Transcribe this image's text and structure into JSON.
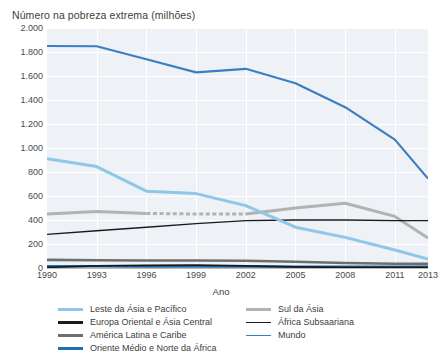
{
  "chart_data": {
    "type": "line",
    "title": "Número na pobreza extrema (milhões)",
    "xlabel": "Ano",
    "ylabel": "",
    "grid": true,
    "legend_position": "bottom",
    "xlim": [
      1990,
      2013
    ],
    "ylim": [
      0,
      2000
    ],
    "yticks": [
      "0",
      "200",
      "400",
      "600",
      "800",
      "1.000",
      "1.200",
      "1.400",
      "1.600",
      "1.800",
      "2.000"
    ],
    "ytick_values": [
      0,
      200,
      400,
      600,
      800,
      1000,
      1200,
      1400,
      1600,
      1800,
      2000
    ],
    "xticks": [
      "1990",
      "1993",
      "1996",
      "1999",
      "2002",
      "2005",
      "2008",
      "2011",
      "2013"
    ],
    "xtick_values": [
      1990,
      1993,
      1996,
      1999,
      2002,
      2005,
      2008,
      2011,
      2013
    ],
    "x": [
      1990,
      1993,
      1996,
      1999,
      2002,
      2005,
      2008,
      2011,
      2013
    ],
    "series": [
      {
        "name": "Mundo",
        "color": "#3a7fc1",
        "width": 2.2,
        "dashed_range": null,
        "values": [
          1850,
          1848,
          1740,
          1630,
          1660,
          1540,
          1340,
          1070,
          745
        ]
      },
      {
        "name": "Leste da Ásia e Pacífico",
        "color": "#8ec7e8",
        "width": 3.0,
        "dashed_range": null,
        "values": [
          910,
          845,
          640,
          620,
          520,
          340,
          255,
          150,
          75
        ]
      },
      {
        "name": "Sul da Ásia",
        "color": "#b2b2b2",
        "width": 3.0,
        "dashed_range": [
          1996,
          2002
        ],
        "values": [
          450,
          470,
          455,
          450,
          450,
          500,
          540,
          430,
          250
        ]
      },
      {
        "name": "África Subsaariana",
        "color": "#1a1a1a",
        "width": 1.4,
        "dashed_range": null,
        "values": [
          280,
          310,
          340,
          370,
          395,
          400,
          400,
          395,
          395
        ]
      },
      {
        "name": "América Latina e Caribe",
        "color": "#6e6e6e",
        "width": 2.6,
        "dashed_range": null,
        "values": [
          68,
          64,
          62,
          62,
          60,
          52,
          42,
          36,
          34
        ]
      },
      {
        "name": "Oriente Médio e Norte da África",
        "color": "#1f6fb5",
        "width": 2.6,
        "dashed_range": null,
        "values": [
          14,
          14,
          13,
          13,
          12,
          11,
          10,
          10,
          10
        ]
      },
      {
        "name": "Europa Oriental e Ásia Central",
        "color": "#1a1a1a",
        "width": 1.8,
        "dashed_range": null,
        "values": [
          6,
          18,
          22,
          24,
          18,
          10,
          6,
          5,
          5
        ]
      }
    ]
  },
  "legend": {
    "left_column": [
      {
        "label": "Leste da Ásia e Pacífico",
        "color": "#8ec7e8",
        "width": 3.0
      },
      {
        "label": "Europa Oriental e Ásia Central",
        "color": "#1a1a1a",
        "width": 3.0
      },
      {
        "label": "América Latina e Caribe",
        "color": "#6e6e6e",
        "width": 3.0
      },
      {
        "label": "Oriente Médio e Norte da África",
        "color": "#1f6fb5",
        "width": 3.0
      }
    ],
    "right_column": [
      {
        "label": "Sul da Ásia",
        "color": "#b2b2b2",
        "width": 3.0
      },
      {
        "label": "África Subsaariana",
        "color": "#1a1a1a",
        "width": 1.6
      },
      {
        "label": "Mundo",
        "color": "#3a7fc1",
        "width": 1.8
      }
    ]
  }
}
